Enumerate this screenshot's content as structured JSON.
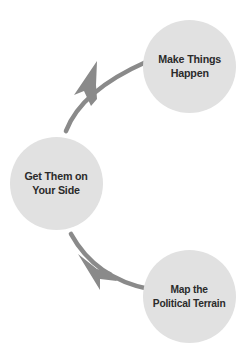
{
  "diagram": {
    "type": "cycle-flow",
    "title": "",
    "colors": {
      "node_fill": "#e1e1e1",
      "node_text": "#2b2b2b",
      "arrow": "#8a8a8a",
      "background": "#ffffff"
    },
    "nodes": [
      {
        "id": "map-the-political-terrain",
        "label": "Map the\nPolitical Terrain",
        "order": 1,
        "position": "bottom-right"
      },
      {
        "id": "get-them-on-your-side",
        "label": "Get Them on\nYour Side",
        "order": 2,
        "position": "middle-left"
      },
      {
        "id": "make-things-happen",
        "label": "Make Things\nHappen",
        "order": 3,
        "position": "top-right"
      }
    ],
    "arrows": [
      {
        "id": "arrow-terrain-to-side",
        "from": "map-the-political-terrain",
        "to": "get-them-on-your-side",
        "direction": "up-left"
      },
      {
        "id": "arrow-side-to-happen",
        "from": "get-them-on-your-side",
        "to": "make-things-happen",
        "direction": "up-right"
      }
    ]
  }
}
